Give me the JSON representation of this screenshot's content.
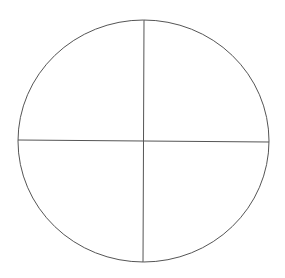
{
  "diagram": {
    "type": "circle-quadrants",
    "stroke_color": "#555555",
    "background": "#ffffff",
    "circle": {
      "cx": 143.5,
      "cy": 141,
      "rx": 125.5,
      "ry": 121
    },
    "vertical_line": {
      "x1": 144,
      "y1": 20,
      "x2": 143,
      "y2": 262
    },
    "horizontal_line": {
      "x1": 18,
      "y1": 140,
      "x2": 269,
      "y2": 142
    },
    "quadrants": [
      "top-left",
      "top-right",
      "bottom-left",
      "bottom-right"
    ]
  }
}
